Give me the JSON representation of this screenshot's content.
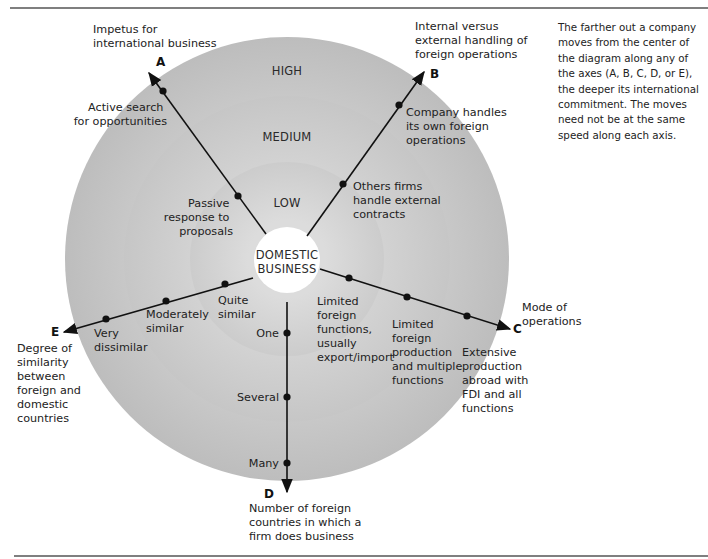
{
  "rings": {
    "high": "HIGH",
    "medium": "MEDIUM",
    "low": "LOW",
    "center": [
      "DOMESTIC",
      "BUSINESS"
    ]
  },
  "colors": {
    "outer_ring": "#c4c4c4",
    "middle_ring": "#cfcfcf",
    "inner_ring": "#d9d9d9",
    "center": "#ffffff",
    "line": "#111111"
  },
  "axes": {
    "A": {
      "letter": "A",
      "title": [
        "Impetus for",
        "international business"
      ],
      "points": [
        [
          "Passive",
          "response to",
          "proposals"
        ],
        [
          "Active search",
          "for opportunities"
        ]
      ]
    },
    "B": {
      "letter": "B",
      "title": [
        "Internal versus",
        "external handling of",
        "foreign operations"
      ],
      "points": [
        [
          "Others firms",
          "handle external",
          "contracts"
        ],
        [
          "Company handles",
          "its own foreign",
          "operations"
        ]
      ]
    },
    "C": {
      "letter": "C",
      "title": [
        "Mode of",
        "operations"
      ],
      "points": [
        [
          "Limited",
          "foreign",
          "functions,",
          "usually",
          "export/import"
        ],
        [
          "Limited",
          "foreign",
          "production",
          "and multiple",
          "functions"
        ],
        [
          "Extensive",
          "production",
          "abroad with",
          "FDI and all",
          "functions"
        ]
      ]
    },
    "D": {
      "letter": "D",
      "title": [
        "Number of foreign",
        "countries in which a",
        "firm does business"
      ],
      "points": [
        "One",
        "Several",
        "Many"
      ]
    },
    "E": {
      "letter": "E",
      "title": [
        "Degree of",
        "similarity",
        "between",
        "foreign and",
        "domestic",
        "countries"
      ],
      "points": [
        [
          "Quite",
          "similar"
        ],
        [
          "Moderately",
          "similar"
        ],
        [
          "Very",
          "dissimilar"
        ]
      ]
    }
  },
  "note": "The farther out a company moves from the center of the diagram along any of the axes (A, B, C, D, or E), the deeper its international commitment. The moves need not be at the same speed along each axis."
}
